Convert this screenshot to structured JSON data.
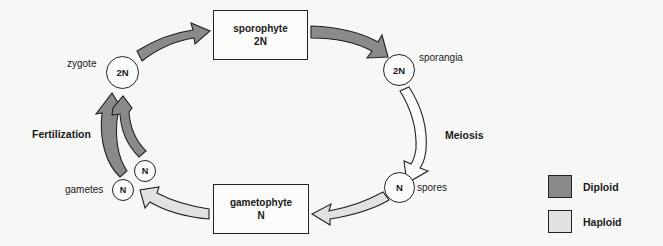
{
  "diagram": {
    "colors": {
      "diploid": "#8a8a8a",
      "haploid": "#e2e2e2",
      "outline": "#222222",
      "background": "#f7f7f5"
    },
    "stages": {
      "sporophyte": {
        "name": "sporophyte",
        "ploidy": "2N"
      },
      "gametophyte": {
        "name": "gametophyte",
        "ploidy": "N"
      }
    },
    "nodes": {
      "zygote": {
        "label": "zygote",
        "ploidy": "2N"
      },
      "sporangia": {
        "label": "sporangia",
        "ploidy": "2N"
      },
      "spores": {
        "label": "spores",
        "ploidy": "N"
      },
      "gametes": {
        "label": "gametes",
        "ploidy_1": "N",
        "ploidy_2": "N"
      }
    },
    "processes": {
      "meiosis": "Meiosis",
      "fertilization": "Fertilization"
    },
    "arrows": [
      {
        "from": "zygote",
        "to": "sporophyte",
        "phase": "diploid"
      },
      {
        "from": "sporophyte",
        "to": "sporangia",
        "phase": "diploid"
      },
      {
        "from": "sporangia",
        "to": "spores",
        "phase": "transition",
        "process": "Meiosis"
      },
      {
        "from": "spores",
        "to": "gametophyte",
        "phase": "haploid"
      },
      {
        "from": "gametophyte",
        "to": "gametes",
        "phase": "haploid"
      },
      {
        "from": "gametes",
        "to": "zygote",
        "phase": "diploid",
        "process": "Fertilization"
      }
    ],
    "legend": [
      {
        "label": "Diploid",
        "color": "#8a8a8a"
      },
      {
        "label": "Haploid",
        "color": "#e2e2e2"
      }
    ]
  }
}
